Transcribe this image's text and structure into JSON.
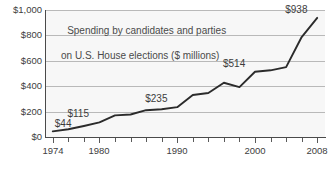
{
  "chart_data": {
    "type": "line",
    "title": "Spending by candidates and parties on U.S. House elections ($ millions)",
    "title_line_1": "Spending by candidates and parties",
    "title_line_2": "on U.S. House elections ($ millions)",
    "xlabel": "",
    "ylabel": "",
    "xlim": [
      1973,
      2009
    ],
    "ylim": [
      0,
      1000
    ],
    "grid": true,
    "legend": "none",
    "yticks": [
      0,
      200,
      400,
      600,
      800,
      1000
    ],
    "ytick_labels": [
      "$0",
      "$200",
      "$400",
      "$600",
      "$800",
      "$1,000"
    ],
    "xticks": [
      1974,
      1976,
      1978,
      1980,
      1982,
      1984,
      1986,
      1988,
      1990,
      1992,
      1994,
      1996,
      1998,
      2000,
      2002,
      2004,
      2006,
      2008
    ],
    "xtick_labels_shown": [
      "1974",
      "1980",
      "1990",
      "2000",
      "2008"
    ],
    "xtick_labeled_years": [
      1974,
      1980,
      1990,
      2000,
      2008
    ],
    "x": [
      1974,
      1976,
      1978,
      1980,
      1982,
      1984,
      1986,
      1988,
      1990,
      1992,
      1994,
      1996,
      1998,
      2000,
      2002,
      2004,
      2006,
      2008
    ],
    "values": [
      44,
      61,
      87,
      115,
      170,
      177,
      211,
      218,
      235,
      331,
      346,
      427,
      393,
      514,
      525,
      550,
      787,
      938
    ],
    "series": [
      {
        "name": "Spending on U.S. House elections",
        "values": [
          44,
          61,
          87,
          115,
          170,
          177,
          211,
          218,
          235,
          331,
          346,
          427,
          393,
          514,
          525,
          550,
          787,
          938
        ]
      }
    ],
    "annotations": [
      {
        "label": "$44",
        "x": 1974,
        "y": 44,
        "position": "above-right"
      },
      {
        "label": "$115",
        "x": 1980,
        "y": 115,
        "position": "above-left"
      },
      {
        "label": "$235",
        "x": 1990,
        "y": 235,
        "position": "above-left"
      },
      {
        "label": "$514",
        "x": 2000,
        "y": 514,
        "position": "above-left"
      },
      {
        "label": "$938",
        "x": 2008,
        "y": 938,
        "position": "above-left"
      }
    ],
    "colors": {
      "line": "#2b2b2b",
      "gridline": "#b9b9b9",
      "axis": "#4a4a4a",
      "plot_background": "#f7f7f7",
      "text": "#404040"
    }
  }
}
